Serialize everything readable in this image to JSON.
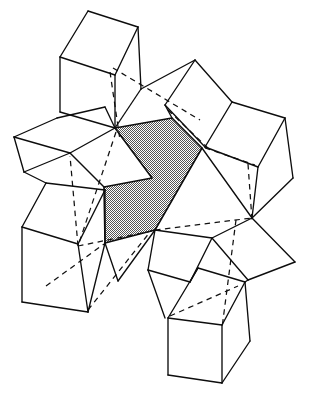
{
  "figure": {
    "caption": "",
    "background_color": "#ffffff",
    "line_color": "#0d0d0d",
    "shaded_fill_color": "#888888",
    "shaded_pattern": "fine-checker-halftone",
    "canvas": {
      "width": 311,
      "height": 395
    },
    "hidden_edge_style": "dashed",
    "visible_edge_style": "solid"
  },
  "geometry": {
    "shaded_face": {
      "name": "central-shaded-hexagon",
      "points": "115,128 172,118 202,148 155,230 105,243 104,187 152,178"
    },
    "white_faces": [
      {
        "name": "top-left-cube-top-face",
        "points": "88,11 138,27 115,75 60,57"
      },
      {
        "name": "top-left-cube-left-face",
        "points": "60,57 115,75 115,128 60,112"
      },
      {
        "name": "top-left-cube-right-face",
        "points": "115,75 138,27 140,88 115,128"
      },
      {
        "name": "upper-left-rhombus",
        "points": "57,118 105,107 115,128 70,153"
      },
      {
        "name": "left-wedge-upper",
        "points": "14,137 57,118 70,153 24,172"
      },
      {
        "name": "left-wedge-lower",
        "points": "24,172 70,153 100,190 55,188"
      },
      {
        "name": "mid-left-face",
        "points": "70,153 115,128 104,187 100,190"
      },
      {
        "name": "bottom-left-cube-top",
        "points": "46,183 105,190 78,244 22,227"
      },
      {
        "name": "bottom-left-cube-left",
        "points": "22,227 78,244 88,312 22,302"
      },
      {
        "name": "bottom-left-cube-right",
        "points": "78,244 105,190 105,243 88,312"
      },
      {
        "name": "top-middle-rhombus",
        "points": "195,60 232,102 205,147 165,105"
      },
      {
        "name": "top-middle-left-face",
        "points": "165,105 195,60 172,118 172,118"
      },
      {
        "name": "upper-mid-triangle",
        "points": "140,88 195,60 172,118"
      },
      {
        "name": "right-cube-top",
        "points": "232,102 285,118 258,167 205,147"
      },
      {
        "name": "right-cube-left",
        "points": "205,147 258,167 252,218 202,148"
      },
      {
        "name": "right-cube-right",
        "points": "258,167 285,118 293,178 252,218"
      },
      {
        "name": "right-lower-rhombus",
        "points": "252,218 295,262 248,280 212,238"
      },
      {
        "name": "mid-lower-rhombus",
        "points": "155,230 212,238 190,282 148,270"
      },
      {
        "name": "lower-center-face",
        "points": "148,270 190,282 198,268 165,318"
      },
      {
        "name": "bottom-right-cube-top",
        "points": "198,268 245,282 222,325 168,318"
      },
      {
        "name": "bottom-right-cube-left",
        "points": "168,318 222,325 222,383 168,375"
      },
      {
        "name": "bottom-right-cube-right",
        "points": "222,325 245,282 250,340 222,383"
      },
      {
        "name": "lower-left-small-face",
        "points": "105,243 155,230 148,270 118,280"
      }
    ],
    "solid_edges": [
      {
        "name": "tl-cube-edge-1",
        "d": "M 88,11 L 138,27"
      },
      {
        "name": "tl-cube-edge-2",
        "d": "M 138,27 L 115,75"
      },
      {
        "name": "tl-cube-edge-3",
        "d": "M 115,75 L 60,57"
      },
      {
        "name": "tl-cube-edge-4",
        "d": "M 60,57 L 88,11"
      },
      {
        "name": "tl-cube-edge-5",
        "d": "M 60,57 L 60,112"
      },
      {
        "name": "tl-cube-edge-6",
        "d": "M 115,75 L 115,128"
      },
      {
        "name": "tl-cube-edge-7",
        "d": "M 138,27 L 141,89"
      },
      {
        "name": "tl-cube-edge-8",
        "d": "M 60,112 L 115,128"
      },
      {
        "name": "tl-cube-edge-9",
        "d": "M 141,89 L 115,128"
      },
      {
        "name": "ul-rhombus-edge-1",
        "d": "M 57,118 L 105,107"
      },
      {
        "name": "ul-rhombus-edge-2",
        "d": "M 105,107 L 115,128"
      },
      {
        "name": "ul-rhombus-edge-3",
        "d": "M 57,118 L 14,137"
      },
      {
        "name": "ul-rhombus-edge-4",
        "d": "M 14,137 L 70,153"
      },
      {
        "name": "ul-rhombus-edge-5",
        "d": "M 70,153 L 115,128"
      },
      {
        "name": "ul-rhombus-edge-6",
        "d": "M 14,137 L 24,172"
      },
      {
        "name": "ul-rhombus-edge-7",
        "d": "M 24,172 L 70,153"
      },
      {
        "name": "ul-rhombus-edge-8",
        "d": "M 24,172 L 46,183"
      },
      {
        "name": "ul-rhombus-edge-9",
        "d": "M 70,153 L 104,187"
      },
      {
        "name": "bl-cube-edge-1",
        "d": "M 46,183 L 105,190"
      },
      {
        "name": "bl-cube-edge-2",
        "d": "M 105,190 L 78,244"
      },
      {
        "name": "bl-cube-edge-3",
        "d": "M 78,244 L 22,227"
      },
      {
        "name": "bl-cube-edge-4",
        "d": "M 22,227 L 46,183"
      },
      {
        "name": "bl-cube-edge-5",
        "d": "M 22,227 L 22,302"
      },
      {
        "name": "bl-cube-edge-6",
        "d": "M 78,244 L 88,312"
      },
      {
        "name": "bl-cube-edge-7",
        "d": "M 22,302 L 88,312"
      },
      {
        "name": "bl-cube-edge-8",
        "d": "M 105,190 L 105,243"
      },
      {
        "name": "bl-cube-edge-9",
        "d": "M 88,312 L 105,243"
      },
      {
        "name": "bl-cube-edge-10",
        "d": "M 105,243 L 118,281"
      },
      {
        "name": "tm-rhombus-edge-1",
        "d": "M 195,60 L 232,102"
      },
      {
        "name": "tm-rhombus-edge-2",
        "d": "M 232,102 L 205,147"
      },
      {
        "name": "tm-rhombus-edge-3",
        "d": "M 205,147 L 165,105"
      },
      {
        "name": "tm-rhombus-edge-4",
        "d": "M 165,105 L 195,60"
      },
      {
        "name": "tm-rhombus-edge-5",
        "d": "M 141,89 L 195,60"
      },
      {
        "name": "tm-rhombus-edge-6",
        "d": "M 165,105 L 172,118"
      },
      {
        "name": "r-cube-edge-1",
        "d": "M 232,102 L 285,118"
      },
      {
        "name": "r-cube-edge-2",
        "d": "M 285,118 L 258,167"
      },
      {
        "name": "r-cube-edge-3",
        "d": "M 258,167 L 205,147"
      },
      {
        "name": "r-cube-edge-4",
        "d": "M 285,118 L 293,178"
      },
      {
        "name": "r-cube-edge-5",
        "d": "M 258,167 L 252,218"
      },
      {
        "name": "r-cube-edge-6",
        "d": "M 293,178 L 252,218"
      },
      {
        "name": "r-cube-edge-7",
        "d": "M 202,148 L 252,218"
      },
      {
        "name": "r-lower-rhombus-edge-1",
        "d": "M 252,218 L 295,262"
      },
      {
        "name": "r-lower-rhombus-edge-2",
        "d": "M 295,262 L 248,280"
      },
      {
        "name": "r-lower-rhombus-edge-3",
        "d": "M 248,280 L 212,238"
      },
      {
        "name": "r-lower-rhombus-edge-4",
        "d": "M 212,238 L 252,218"
      },
      {
        "name": "mid-lower-edge-1",
        "d": "M 155,230 L 212,238"
      },
      {
        "name": "mid-lower-edge-2",
        "d": "M 212,238 L 190,282"
      },
      {
        "name": "mid-lower-edge-3",
        "d": "M 190,282 L 148,270"
      },
      {
        "name": "mid-lower-edge-4",
        "d": "M 148,270 L 155,230"
      },
      {
        "name": "mid-lower-edge-5",
        "d": "M 155,230 L 118,281"
      },
      {
        "name": "mid-lower-edge-6",
        "d": "M 148,270 L 165,318"
      },
      {
        "name": "mid-lower-edge-7",
        "d": "M 190,282 L 198,268"
      },
      {
        "name": "mid-lower-edge-8",
        "d": "M 248,280 L 245,282"
      },
      {
        "name": "br-cube-edge-1",
        "d": "M 198,268 L 245,282"
      },
      {
        "name": "br-cube-edge-2",
        "d": "M 245,282 L 222,325"
      },
      {
        "name": "br-cube-edge-3",
        "d": "M 222,325 L 168,318"
      },
      {
        "name": "br-cube-edge-4",
        "d": "M 168,318 L 198,268"
      },
      {
        "name": "br-cube-edge-5",
        "d": "M 168,318 L 168,375"
      },
      {
        "name": "br-cube-edge-6",
        "d": "M 222,325 L 222,383"
      },
      {
        "name": "br-cube-edge-7",
        "d": "M 245,282 L 250,341"
      },
      {
        "name": "br-cube-edge-8",
        "d": "M 168,375 L 222,383"
      },
      {
        "name": "br-cube-edge-9",
        "d": "M 222,383 L 250,341"
      }
    ],
    "hidden_edges": [
      {
        "name": "hidden-tl-vertical",
        "d": "M 110,72 L 120,140"
      },
      {
        "name": "hidden-diag-ne",
        "d": "M 113,68 L 200,120"
      },
      {
        "name": "hidden-diag-sw-long",
        "d": "M 116,132 L 78,246"
      },
      {
        "name": "hidden-left-long",
        "d": "M 78,246 L 70,156"
      },
      {
        "name": "hidden-bl-to-center",
        "d": "M 78,246 L 152,231"
      },
      {
        "name": "hidden-center-to-rc",
        "d": "M 155,230 L 252,218"
      },
      {
        "name": "hidden-right-vertical",
        "d": "M 248,164 L 252,220"
      },
      {
        "name": "hidden-tm-inner",
        "d": "M 168,110 L 210,150"
      },
      {
        "name": "hidden-rc-diag",
        "d": "M 205,148 L 255,165"
      },
      {
        "name": "hidden-br-vertical",
        "d": "M 236,220 L 222,328"
      },
      {
        "name": "hidden-br-top",
        "d": "M 170,316 L 238,286"
      },
      {
        "name": "hidden-bl-lower",
        "d": "M 46,286 L 104,244"
      },
      {
        "name": "hidden-left-low-diag",
        "d": "M 88,310 L 150,232"
      }
    ]
  }
}
